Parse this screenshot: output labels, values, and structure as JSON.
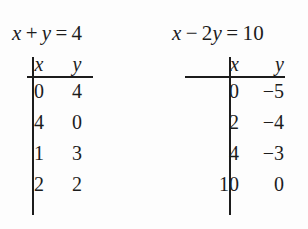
{
  "figure": {
    "kind": "two-equation-solution-tables",
    "background_color": "#fdfdfd",
    "ink_color": "#1c1c1c"
  },
  "panels": [
    {
      "equation": {
        "full": "x + y = 4",
        "lhs_var1": "x",
        "operator": "+",
        "lhs_var2": "y",
        "equals": "=",
        "rhs": "4"
      },
      "table": {
        "headers": [
          "x",
          "y"
        ],
        "rows": [
          {
            "x": "0",
            "y": "4"
          },
          {
            "x": "4",
            "y": "0"
          },
          {
            "x": "1",
            "y": "3"
          },
          {
            "x": "2",
            "y": "2"
          }
        ]
      }
    },
    {
      "equation": {
        "full": "x − 2y = 10",
        "lhs_var1": "x",
        "operator": "−",
        "coefficient": "2",
        "lhs_var2": "y",
        "equals": "=",
        "rhs": "10"
      },
      "table": {
        "headers": [
          "x",
          "y"
        ],
        "rows": [
          {
            "x": "0",
            "y": "−5"
          },
          {
            "x": "2",
            "y": "−4"
          },
          {
            "x": "4",
            "y": "−3"
          },
          {
            "x": "10",
            "y": "0"
          }
        ]
      }
    }
  ],
  "chart_data": {
    "type": "table",
    "title": "",
    "tables": [
      {
        "caption": "x + y = 4",
        "columns": [
          "x",
          "y"
        ],
        "rows": [
          [
            0,
            4
          ],
          [
            4,
            0
          ],
          [
            1,
            3
          ],
          [
            2,
            2
          ]
        ]
      },
      {
        "caption": "x − 2y = 10",
        "columns": [
          "x",
          "y"
        ],
        "rows": [
          [
            0,
            -5
          ],
          [
            2,
            -4
          ],
          [
            4,
            -3
          ],
          [
            10,
            0
          ]
        ]
      }
    ]
  }
}
